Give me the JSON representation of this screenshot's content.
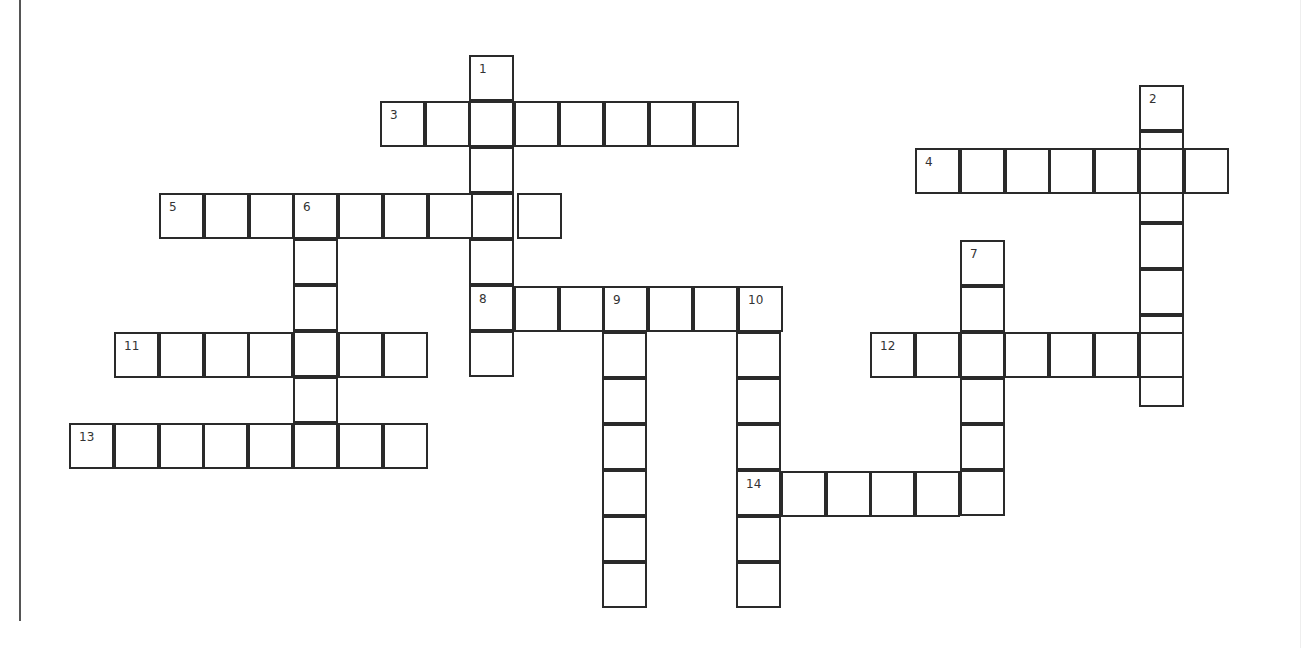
{
  "puzzle": {
    "type": "crossword",
    "cell_w": 44.8,
    "cell_h": 46,
    "words": [
      {
        "number": "1",
        "direction": "down",
        "x": 469,
        "y": 55,
        "length": 7
      },
      {
        "number": "2",
        "direction": "down",
        "x": 1139,
        "y": 85,
        "length": 7
      },
      {
        "number": "3",
        "direction": "across",
        "x": 380,
        "y": 101,
        "length": 8
      },
      {
        "number": "4",
        "direction": "across",
        "x": 915,
        "y": 148,
        "length": 7
      },
      {
        "number": "5",
        "direction": "across",
        "x": 159,
        "y": 193,
        "length": 9
      },
      {
        "number": "6",
        "direction": "down",
        "x": 293,
        "y": 193,
        "length": 6
      },
      {
        "number": "7",
        "direction": "down",
        "x": 960,
        "y": 240,
        "length": 6
      },
      {
        "number": "8",
        "direction": "across",
        "x": 469,
        "y": 286,
        "length": 7
      },
      {
        "number": "9",
        "direction": "down",
        "x": 602,
        "y": 286,
        "length": 7
      },
      {
        "number": "10",
        "direction": "down",
        "x": 736,
        "y": 286,
        "length": 7
      },
      {
        "number": "11",
        "direction": "across",
        "x": 114,
        "y": 332,
        "length": 7
      },
      {
        "number": "12",
        "direction": "across",
        "x": 870,
        "y": 332,
        "length": 7
      },
      {
        "number": "13",
        "direction": "across",
        "x": 69,
        "y": 423,
        "length": 8
      },
      {
        "number": "14",
        "direction": "across",
        "x": 736,
        "y": 471,
        "length": 6
      }
    ]
  }
}
